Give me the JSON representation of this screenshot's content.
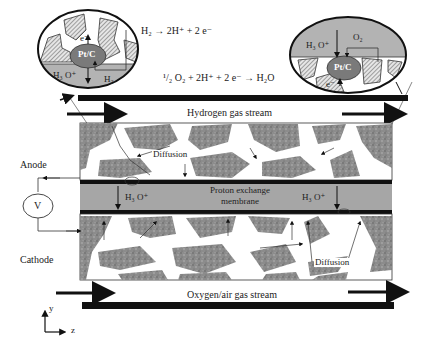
{
  "diagram": {
    "colors": {
      "background": "#ffffff",
      "porous_layer": "#8a8a8a",
      "membrane": "#a6a6a6",
      "bar": "#111111",
      "catalyst_particle": "#7a7a7a",
      "ellipse_gas": "#b0b0b0"
    },
    "reactions": {
      "anode": "H₂ → 2H⁺ + 2 e⁻",
      "cathode": "¹/₂ O₂ + 2H⁺ + 2 e⁻ → H₂O"
    },
    "insets": {
      "anode_inset": {
        "particle": "Pt/C",
        "electron": "e⁻",
        "ion": "H₃ O⁺",
        "gas": "H₂"
      },
      "cathode_inset": {
        "particle": "Pt/C",
        "electron": "e⁻",
        "ion": "H₃ O⁺",
        "gas": "O₂"
      }
    },
    "streams": {
      "top": "Hydrogen gas stream",
      "bottom": "Oxygen/air gas stream"
    },
    "electrodes": {
      "anode": "Anode",
      "cathode": "Cathode"
    },
    "voltmeter": "V",
    "membrane": {
      "line1": "Proton exchange",
      "line2": "membrane"
    },
    "membrane_ions": [
      "H₃ O⁺",
      "H₃ O⁺"
    ],
    "diffusion_labels": [
      "Diffusion",
      "Diffusion"
    ],
    "axes": {
      "y": "y",
      "z": "z"
    }
  }
}
